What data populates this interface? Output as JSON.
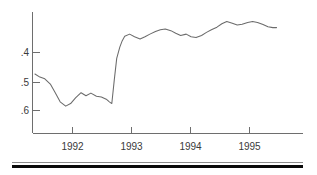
{
  "chart_data": {
    "type": "line",
    "title": "",
    "subtitle": "",
    "xlabel": "",
    "ylabel": "",
    "grid": false,
    "legend_position": "none",
    "y_axis_inverted": true,
    "xlim": [
      1991.5,
      1995.9
    ],
    "ylim": [
      0.635,
      0.355
    ],
    "yticks": [
      0.4,
      0.5,
      0.6
    ],
    "ytick_labels": [
      ".4",
      ".5",
      ".6"
    ],
    "xticks": [
      1992,
      1993,
      1994,
      1995
    ],
    "xtick_labels": [
      "1992",
      "1993",
      "1994",
      "1995"
    ],
    "series": [
      {
        "name": "series-1",
        "x": [
          1991.54,
          1991.62,
          1991.7,
          1991.79,
          1991.87,
          1991.95,
          1992.04,
          1992.12,
          1992.2,
          1992.29,
          1992.37,
          1992.45,
          1992.54,
          1992.62,
          1992.7,
          1992.75,
          1992.79,
          1992.83,
          1992.87,
          1992.92,
          1992.96,
          1993.0,
          1993.08,
          1993.16,
          1993.25,
          1993.33,
          1993.41,
          1993.5,
          1993.58,
          1993.66,
          1993.75,
          1993.83,
          1993.91,
          1994.0,
          1994.08,
          1994.16,
          1994.25,
          1994.33,
          1994.41,
          1994.5,
          1994.58,
          1994.66,
          1994.75,
          1994.83,
          1994.91,
          1995.0,
          1995.08,
          1995.16,
          1995.25,
          1995.33,
          1995.41,
          1995.47
        ],
        "y": [
          0.498,
          0.505,
          0.509,
          0.521,
          0.541,
          0.562,
          0.572,
          0.566,
          0.553,
          0.541,
          0.548,
          0.542,
          0.549,
          0.551,
          0.556,
          0.562,
          0.566,
          0.512,
          0.462,
          0.436,
          0.421,
          0.411,
          0.406,
          0.412,
          0.417,
          0.412,
          0.406,
          0.4,
          0.396,
          0.394,
          0.398,
          0.404,
          0.409,
          0.406,
          0.412,
          0.414,
          0.409,
          0.402,
          0.396,
          0.39,
          0.382,
          0.377,
          0.381,
          0.385,
          0.383,
          0.379,
          0.377,
          0.379,
          0.384,
          0.389,
          0.391,
          0.391
        ]
      }
    ]
  },
  "footer_rules": {
    "thin_rule": "horizontal-rule-thin",
    "thick_rule": "horizontal-rule-thick"
  }
}
